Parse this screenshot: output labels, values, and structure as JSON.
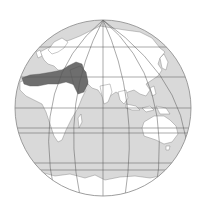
{
  "map": {
    "projection": "orthographic-like globe, Eastern Hemisphere",
    "colors": {
      "ocean": "#d9d9d9",
      "land": "#ffffff",
      "highlight": "#6e6e6e",
      "grid": "#555555",
      "coast": "#777777",
      "rim": "#888888"
    },
    "highlighted_region": "North Africa and Middle East",
    "visible_continents": [
      "Europe",
      "Asia",
      "Africa",
      "Australia",
      "Antarctica (edge)"
    ]
  }
}
